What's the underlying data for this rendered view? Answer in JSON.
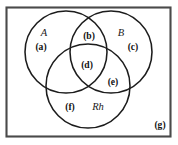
{
  "figure": {
    "type": "venn-diagram-3-set",
    "background_color": "#ffffff",
    "border_color": "#4a4a4a",
    "stroke_color": "#1c1c1c"
  },
  "sets": [
    {
      "id": "A",
      "label": "A",
      "cx": 66,
      "cy": 52,
      "r": 41,
      "label_x": 44,
      "label_y": 36
    },
    {
      "id": "B",
      "label": "B",
      "cx": 111,
      "cy": 52,
      "r": 41,
      "label_x": 121,
      "label_y": 36
    },
    {
      "id": "Rh",
      "label": "Rh",
      "cx": 88,
      "cy": 86,
      "r": 42,
      "label_x": 98,
      "label_y": 110
    }
  ],
  "regions": [
    {
      "id": "a",
      "label": "(a)",
      "x": 41,
      "y": 50,
      "meaning": "A only"
    },
    {
      "id": "b",
      "label": "(b)",
      "x": 89,
      "y": 39,
      "meaning": "A and B"
    },
    {
      "id": "c",
      "label": "(c)",
      "x": 133,
      "y": 50,
      "meaning": "B only"
    },
    {
      "id": "d",
      "label": "(d)",
      "x": 87,
      "y": 68,
      "meaning": "A and B and Rh"
    },
    {
      "id": "e",
      "label": "(e)",
      "x": 113,
      "y": 85,
      "meaning": "B and Rh"
    },
    {
      "id": "f",
      "label": "(f)",
      "x": 70,
      "y": 110,
      "meaning": "Rh only"
    },
    {
      "id": "g",
      "label": "(g)",
      "x": 160,
      "y": 128,
      "meaning": "outside all sets"
    }
  ],
  "universe": {
    "x": 6.5,
    "y": 7.5,
    "width": 164,
    "height": 129
  }
}
